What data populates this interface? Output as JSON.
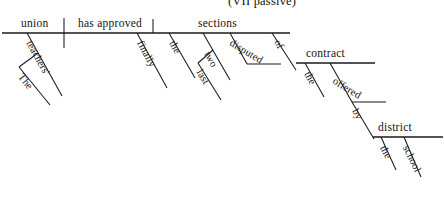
{
  "figure": {
    "title": "(VII passive)",
    "type": "reed-kellogg-sentence-diagram",
    "sentence": "The teachers' union has finally approved the last two disputed sections of the contract offered by the school district.",
    "ink_color": "#1a1a1a",
    "background_color": "#ffffff"
  },
  "words": {
    "subject": "union",
    "verb": "has approved",
    "subject_modifier_possessive": "teachers'",
    "subject_modifier_article": "The",
    "verb_modifier_adverb": "finally",
    "direct_object": "sections",
    "object_modifier_article": "the",
    "object_modifier_number": "two",
    "object_modifier_last": "last",
    "object_modifier_participle": "disputed",
    "preposition_of": "of",
    "prep_object_contract": "contract",
    "contract_article": "the",
    "contract_participle": "offered",
    "preposition_by": "by",
    "prep_object_district": "district",
    "district_article": "the",
    "district_modifier_school": "school"
  }
}
